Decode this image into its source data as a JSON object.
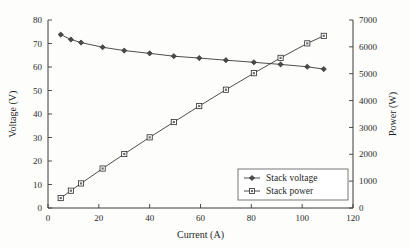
{
  "chart_data": {
    "type": "line",
    "title": "",
    "xlabel": "Current (A)",
    "ylabel": "Voltage (V)",
    "y2label": "Power (W)",
    "xlim": [
      0,
      120
    ],
    "ylim": [
      0,
      80
    ],
    "y2lim": [
      0,
      7000
    ],
    "grid": false,
    "legend_position": "lower right",
    "xticks": [
      0,
      20,
      40,
      60,
      80,
      100,
      120
    ],
    "yticks": [
      0,
      10,
      20,
      30,
      40,
      50,
      60,
      70,
      80
    ],
    "y2ticks": [
      0,
      1000,
      2000,
      3000,
      4000,
      5000,
      6000,
      7000
    ],
    "series": [
      {
        "name": "Stack voltage",
        "axis": "left",
        "marker": "diamond",
        "x": [
          5,
          9,
          13,
          21.5,
          30,
          40,
          49.5,
          59.5,
          70,
          81,
          91.5,
          102,
          108.5
        ],
        "y": [
          73.8,
          71.7,
          70.4,
          68.4,
          67.0,
          65.8,
          64.6,
          63.8,
          62.9,
          62.0,
          61.1,
          60.1,
          59.1
        ]
      },
      {
        "name": "Stack power",
        "axis": "right",
        "marker": "square",
        "x": [
          5,
          9,
          13,
          21.5,
          30,
          40,
          49.5,
          59.5,
          70,
          81,
          91.5,
          102,
          108.5
        ],
        "y": [
          370,
          645,
          915,
          1470,
          2010,
          2630,
          3200,
          3795,
          4405,
          5020,
          5590,
          6130,
          6410
        ]
      }
    ]
  },
  "legend": {
    "entries": [
      {
        "label": "Stack voltage",
        "marker": "diamond"
      },
      {
        "label": "Stack power",
        "marker": "square"
      }
    ]
  },
  "axes": {
    "x_title": "Current (A)",
    "y_left_title": "Voltage (V)",
    "y_right_title": "Power (W)"
  }
}
